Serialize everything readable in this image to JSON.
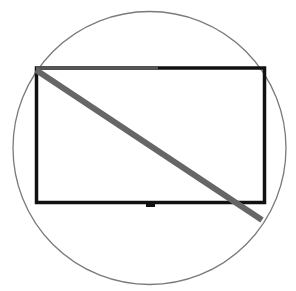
{
  "icon": {
    "name": "no-tv-icon",
    "description": "Television outline inside a circle with diagonal strike-through",
    "colors": {
      "background": "#ffffff",
      "circle": "#7a7a7a",
      "tv_frame": "#111111",
      "strike": "#666666"
    }
  }
}
